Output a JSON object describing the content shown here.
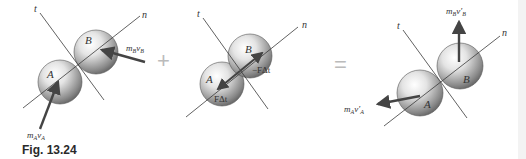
{
  "figure": {
    "caption": "Fig. 13.24",
    "operators": {
      "plus": "+",
      "equals": "="
    },
    "colors": {
      "sphere_light": "#f2f2f2",
      "sphere_dark": "#6e6e6e",
      "line": "#3a3a3a",
      "arrow": "#444444",
      "operator": "#bbbbbb"
    },
    "panels": [
      {
        "name": "before-impact",
        "axes": {
          "t": "t",
          "n": "n"
        },
        "spheres": [
          "A",
          "B"
        ],
        "vectors": [
          {
            "label_main": "m",
            "sub1": "A",
            "label_v": "v",
            "sub2": "A"
          },
          {
            "label_main": "m",
            "sub1": "B",
            "label_v": "v",
            "sub2": "B"
          }
        ]
      },
      {
        "name": "impulse",
        "axes": {
          "t": "t",
          "n": "n"
        },
        "spheres": [
          "A",
          "B"
        ],
        "impulses": [
          {
            "sphere": "A",
            "label": "FΔt"
          },
          {
            "sphere": "B",
            "label": "−FΔt"
          }
        ]
      },
      {
        "name": "after-impact",
        "axes": {
          "t": "t",
          "n": "n"
        },
        "spheres": [
          "A",
          "B"
        ],
        "vectors": [
          {
            "label_main": "m",
            "sub1": "A",
            "label_v": "v′",
            "sub2": "A"
          },
          {
            "label_main": "m",
            "sub1": "B",
            "label_v": "v′",
            "sub2": "B"
          }
        ]
      }
    ]
  }
}
